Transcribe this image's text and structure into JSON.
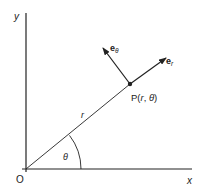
{
  "diagram": {
    "axes": {
      "x_label": "x",
      "y_label": "y",
      "origin_label": "O"
    },
    "point": {
      "label_prefix": "P(",
      "r": "r",
      "sep": ", ",
      "theta": "θ",
      "label_suffix": ")"
    },
    "radius_label": "r",
    "angle_label": "θ",
    "unit_vectors": {
      "e_r": {
        "base": "e",
        "sub": "r"
      },
      "e_theta": {
        "base": "e",
        "sub": "θ"
      }
    },
    "colors": {
      "ink": "#222222",
      "background": "#ffffff"
    }
  }
}
